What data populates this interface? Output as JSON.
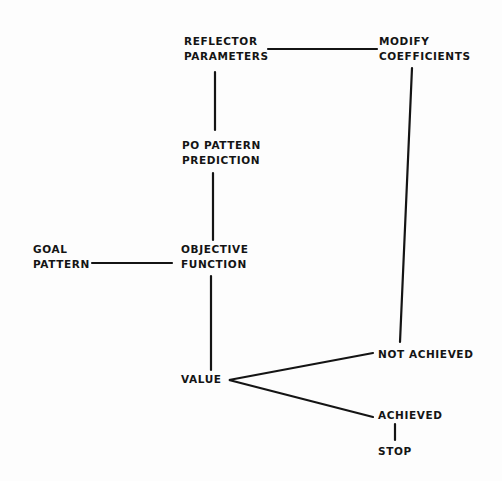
{
  "diagram": {
    "type": "flowchart",
    "nodes": {
      "reflector_parameters": {
        "line1": "REFLECTOR",
        "line2": "PARAMETERS"
      },
      "modify_coefficients": {
        "line1": "MODIFY",
        "line2": "COEFFICIENTS"
      },
      "po_pattern_prediction": {
        "line1": "PO PATTERN",
        "line2": "PREDICTION"
      },
      "goal_pattern": {
        "line1": "GOAL",
        "line2": "PATTERN"
      },
      "objective_function": {
        "line1": "OBJECTIVE",
        "line2": "FUNCTION"
      },
      "value": {
        "label": "VALUE"
      },
      "not_achieved": {
        "label": "NOT ACHIEVED"
      },
      "achieved": {
        "label": "ACHIEVED"
      },
      "stop": {
        "label": "STOP"
      }
    },
    "edges": [
      {
        "from": "reflector_parameters",
        "to": "modify_coefficients"
      },
      {
        "from": "reflector_parameters",
        "to": "po_pattern_prediction"
      },
      {
        "from": "po_pattern_prediction",
        "to": "objective_function"
      },
      {
        "from": "goal_pattern",
        "to": "objective_function"
      },
      {
        "from": "objective_function",
        "to": "value"
      },
      {
        "from": "value",
        "to": "not_achieved"
      },
      {
        "from": "value",
        "to": "achieved"
      },
      {
        "from": "not_achieved",
        "to": "modify_coefficients"
      },
      {
        "from": "achieved",
        "to": "stop"
      }
    ],
    "colors": {
      "ink": "#141414",
      "paper": "#fdfdfd"
    }
  }
}
